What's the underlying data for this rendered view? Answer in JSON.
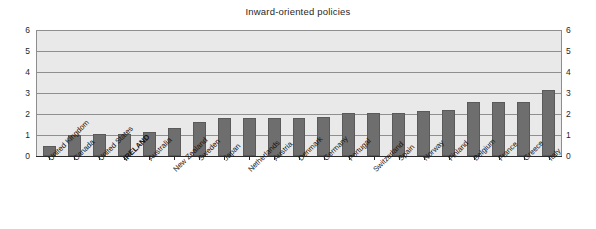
{
  "chart_data": {
    "type": "bar",
    "title": "Inward-oriented policies",
    "xlabel": "",
    "ylabel": "",
    "ylim": [
      0,
      6
    ],
    "yticks": [
      0,
      1,
      2,
      3,
      4,
      5,
      6
    ],
    "grid": true,
    "legend": false,
    "dual_y_axis": true,
    "highlight_category": "IRELAND",
    "bar_color": "#6e6e6e",
    "plot_background": "#e9e9e9",
    "categories": [
      "United Kingdom",
      "Canada",
      "United States",
      "IRELAND",
      "Australia",
      "New Zealand",
      "Sweden",
      "Japan",
      "Netherlands",
      "Austria",
      "Denmark",
      "Germany",
      "Portugal",
      "Switzerland",
      "Spain",
      "Norway",
      "Finland",
      "Belgium",
      "France",
      "Greece",
      "Italy"
    ],
    "values": [
      0.5,
      1.0,
      1.03,
      1.05,
      1.12,
      1.35,
      1.6,
      1.8,
      1.8,
      1.8,
      1.82,
      1.88,
      2.05,
      2.05,
      2.05,
      2.13,
      2.18,
      2.55,
      2.55,
      2.58,
      3.15
    ],
    "axis_left_ticks": [
      "0",
      "1",
      "2",
      "3",
      "4",
      "5",
      "6"
    ],
    "axis_right_ticks": [
      "0",
      "1",
      "2",
      "3",
      "4",
      "5",
      "6"
    ]
  }
}
